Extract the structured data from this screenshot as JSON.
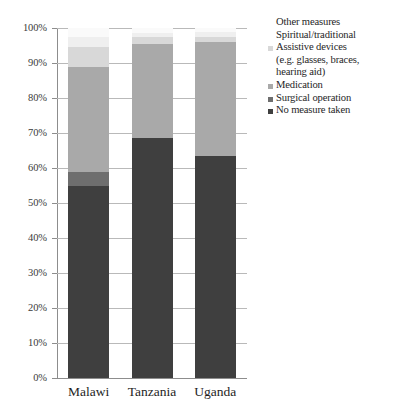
{
  "chart_data": {
    "type": "bar",
    "subtype": "stacked-100-percent",
    "title": "",
    "xlabel": "",
    "ylabel": "",
    "ylim": [
      0,
      100
    ],
    "ytick_labels": [
      "100%",
      "90%",
      "80%",
      "70%",
      "60%",
      "50%",
      "40%",
      "30%",
      "20%",
      "10%",
      "0%"
    ],
    "ytick_values": [
      100,
      90,
      80,
      70,
      60,
      50,
      40,
      30,
      20,
      10,
      0
    ],
    "grid": true,
    "legend_position": "right",
    "categories": [
      "Malawi",
      "Tanzania",
      "Uganda"
    ],
    "series": [
      {
        "name": "No measure taken",
        "color": "#3f3f3f",
        "values": [
          55.0,
          68.5,
          63.5
        ]
      },
      {
        "name": "Surgical operation",
        "color": "#6e6e6e",
        "values": [
          4.0,
          0.0,
          0.0
        ]
      },
      {
        "name": "Medication",
        "color": "#a9a9a9",
        "values": [
          30.0,
          27.0,
          32.5
        ]
      },
      {
        "name": "Assistive devices (e.g. glasses, braces, hearing aid)",
        "color": "#d8d8d8",
        "values": [
          5.5,
          2.0,
          1.5
        ]
      },
      {
        "name": "Spiritual/traditional",
        "color": "#efefef",
        "values": [
          3.0,
          1.0,
          1.5
        ]
      },
      {
        "name": "Other measures",
        "color": "#fafafa",
        "values": [
          2.5,
          1.5,
          1.0
        ]
      }
    ]
  },
  "legend": {
    "entries": [
      {
        "label": "Other measures",
        "marker": false
      },
      {
        "label": "Spiritual/traditional",
        "marker": false
      },
      {
        "label": "Assistive devices",
        "sub1": "(e.g. glasses, braces,",
        "sub2": "hearing aid)",
        "marker": true
      },
      {
        "label": "Medication",
        "marker": true
      },
      {
        "label": "Surgical operation",
        "marker": true
      },
      {
        "label": "No measure taken",
        "marker": true
      }
    ]
  }
}
